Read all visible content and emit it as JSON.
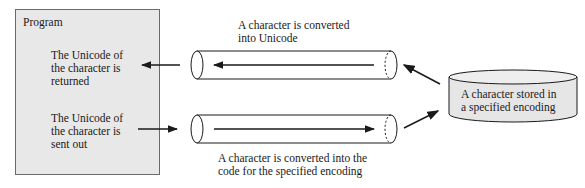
{
  "program": {
    "title": "Program",
    "returned_label": "The Unicode of\nthe character is\nreturned",
    "sent_label": "The Unicode of\nthe character is\nsent out"
  },
  "pipes": {
    "top_label": "A character is converted\ninto Unicode",
    "bottom_label": "A character is converted into the\ncode for the specified encoding"
  },
  "storage": {
    "label": "A character stored in\na specified encoding"
  },
  "colors": {
    "program_bg": "#e8e8e8",
    "storage_bg": "#e6e6e6",
    "line": "#1a1a1a"
  }
}
